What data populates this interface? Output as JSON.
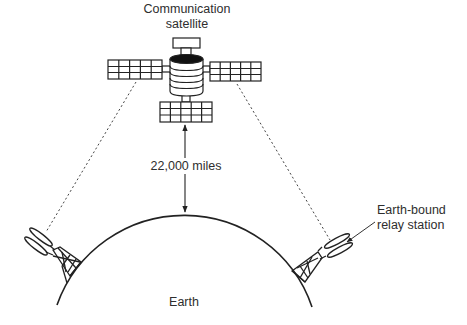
{
  "diagram": {
    "labels": {
      "satellite_line1": "Communication",
      "satellite_line2": "satellite",
      "distance": "22,000 miles",
      "station_line1": "Earth-bound",
      "station_line2": "relay station",
      "earth": "Earth"
    },
    "colors": {
      "stroke": "#222222",
      "text": "#2e2e2e",
      "background": "#ffffff",
      "satellite_top_fill": "#111111"
    },
    "elements": [
      {
        "id": "satellite",
        "type": "satellite",
        "parts": [
          "antenna",
          "cylindrical-body",
          "left-solar-panel",
          "right-solar-panel",
          "bottom-solar-panel"
        ]
      },
      {
        "id": "distance-arrow",
        "type": "double-arrow",
        "from": "satellite",
        "to": "earth"
      },
      {
        "id": "earth",
        "type": "arc"
      },
      {
        "id": "left-relay-station",
        "type": "tower"
      },
      {
        "id": "right-relay-station",
        "type": "tower"
      },
      {
        "id": "left-signal",
        "type": "dotted-line",
        "from": "satellite",
        "to": "left-relay-station"
      },
      {
        "id": "right-signal",
        "type": "dotted-line",
        "from": "satellite",
        "to": "right-relay-station"
      }
    ]
  }
}
